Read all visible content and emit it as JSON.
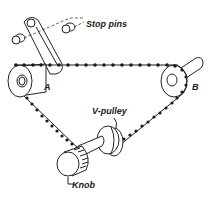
{
  "diagram": {
    "type": "mechanical-line-drawing",
    "labels": {
      "stop_pins": "Stop pins",
      "pulley_a": "A",
      "pulley_b": "B",
      "v_pulley": "V-pulley",
      "knob": "Knob"
    },
    "colors": {
      "ink": "#222222",
      "background": "#ffffff"
    }
  }
}
